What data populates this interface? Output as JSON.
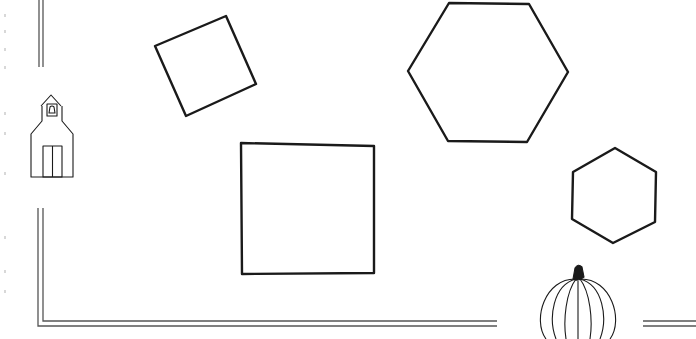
{
  "worksheet": {
    "description": "Coloring/worksheet page with geometric shapes and seasonal decorations",
    "stroke_color": "#1a1a1a",
    "border_color": "#555555",
    "background": "#ffffff"
  },
  "shapes": [
    {
      "id": "rotated-square",
      "type": "square",
      "points": "155,46 226,16 256,84 186,116"
    },
    {
      "id": "large-hexagon",
      "type": "hexagon",
      "points": "449,3 529,4 568,72 527,142 448,141 408,71"
    },
    {
      "id": "large-square",
      "type": "square",
      "points": "241,143 374,146 374,273 242,274"
    },
    {
      "id": "small-hexagon",
      "type": "hexagon",
      "points": "615,148 656,172 655,222 613,243 572,219 573,172"
    }
  ],
  "decorations": [
    {
      "id": "schoolhouse",
      "label": "schoolhouse"
    },
    {
      "id": "pumpkin",
      "label": "pumpkin"
    }
  ]
}
